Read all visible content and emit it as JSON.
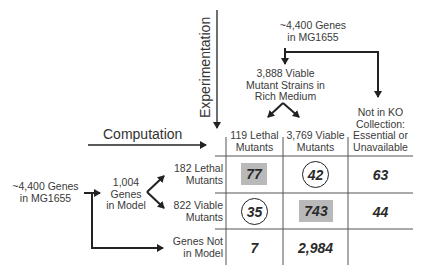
{
  "labels": {
    "experimentation": "Experimentation",
    "computation": "Computation",
    "top_genes": [
      "~4,400 Genes",
      "in MG1655"
    ],
    "viable_strains": [
      "3,888 Viable",
      "Mutant Strains in",
      "Rich Medium"
    ],
    "not_in_ko": [
      "Not in KO",
      "Collection:",
      "Essential or",
      "Unavailable"
    ],
    "left_genes": [
      "~4,400 Genes",
      "in MG1655"
    ],
    "genes_in_model": [
      "1,004",
      "Genes",
      "in Model"
    ]
  },
  "table": {
    "columns": [
      [
        "119 Lethal",
        "Mutants"
      ],
      [
        "3,769 Viable",
        "Mutants"
      ],
      [
        "Not in KO",
        "Collection:",
        "Essential or",
        "Unavailable"
      ]
    ],
    "rows": [
      {
        "label": [
          "182 Lethal",
          "Mutants"
        ],
        "cells": [
          "77",
          "42",
          "63"
        ],
        "styles": [
          "shaded",
          "circled",
          "plain"
        ]
      },
      {
        "label": [
          "822 Viable",
          "Mutants"
        ],
        "cells": [
          "35",
          "743",
          "44"
        ],
        "styles": [
          "circled",
          "shaded",
          "plain"
        ]
      },
      {
        "label": [
          "Genes Not",
          "in Model"
        ],
        "cells": [
          "7",
          "2,984",
          ""
        ],
        "styles": [
          "plain",
          "plain",
          "plain"
        ]
      }
    ]
  },
  "colors": {
    "shade": "#b9b9b9",
    "lines": "#222222",
    "grid": "#555555",
    "text": "#3a3a3a"
  }
}
